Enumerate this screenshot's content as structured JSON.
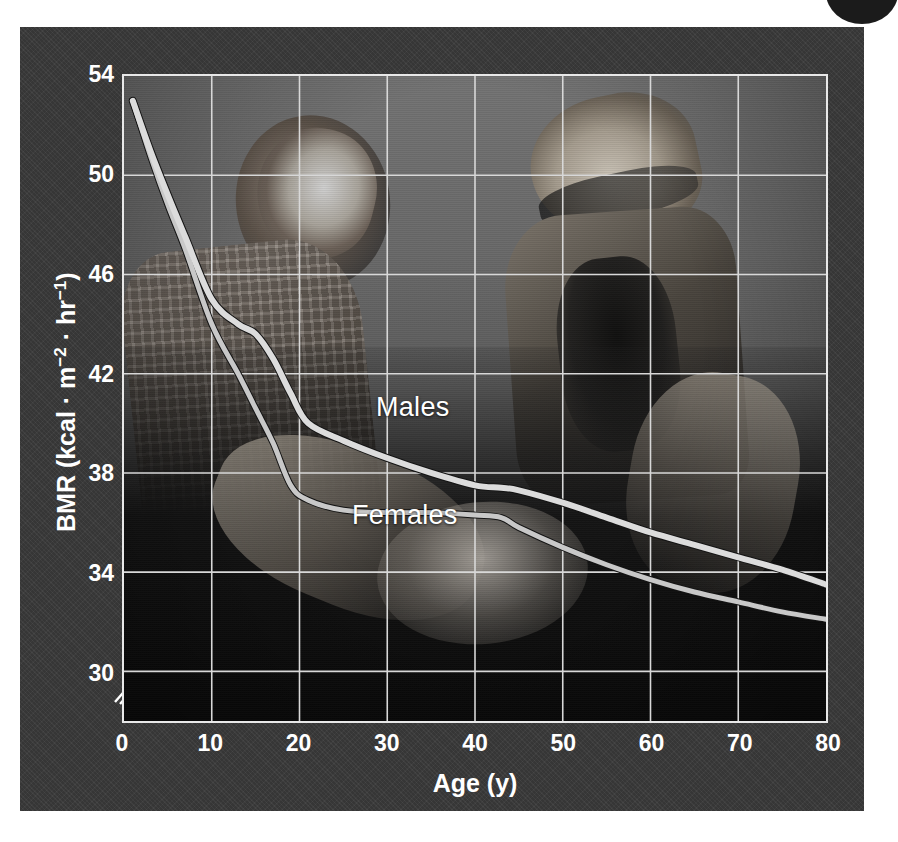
{
  "figure": {
    "background_color": "#3a3a3a",
    "plot_frame_color": "#e8e8e8",
    "grid_color": "#d8d8d8",
    "males_color": "#dcdcdc",
    "females_color": "#c8c8c8"
  },
  "chart_data": {
    "type": "line",
    "title": "",
    "xlabel": "Age (y)",
    "ylabel": "BMR (kcal · m−2 · hr−1)",
    "ylabel_parts": {
      "prefix": "BMR (kcal · m",
      "sup1": "−2",
      "middle": " · hr",
      "sup2": "−1",
      "suffix": ")"
    },
    "xlim": [
      0,
      80
    ],
    "ylim": [
      28,
      54
    ],
    "xticks": [
      0,
      10,
      20,
      30,
      40,
      50,
      60,
      70,
      80
    ],
    "xticklabels": [
      "0",
      "10",
      "20",
      "30",
      "40",
      "50",
      "60",
      "70",
      "80"
    ],
    "yticks": [
      30,
      34,
      38,
      42,
      46,
      50,
      54
    ],
    "yticklabels": [
      "30",
      "34",
      "38",
      "42",
      "46",
      "50",
      "54"
    ],
    "grid": true,
    "legend_position": "inline-annotations",
    "axis_break": "y-axis below 30",
    "series": [
      {
        "name": "Males",
        "label": "Males",
        "x": [
          1,
          3,
          5,
          7,
          10,
          13,
          15,
          17,
          19,
          21,
          25,
          30,
          35,
          40,
          43,
          45,
          50,
          55,
          60,
          65,
          70,
          75,
          80
        ],
        "y": [
          53.0,
          51.0,
          49.2,
          47.5,
          45.0,
          44.0,
          43.6,
          42.6,
          41.2,
          40.0,
          39.3,
          38.6,
          38.0,
          37.5,
          37.4,
          37.3,
          36.8,
          36.2,
          35.6,
          35.1,
          34.6,
          34.1,
          33.5
        ]
      },
      {
        "name": "Females",
        "label": "Females",
        "x": [
          1,
          3,
          5,
          7,
          10,
          13,
          15,
          17,
          19,
          21,
          25,
          30,
          35,
          40,
          43,
          45,
          50,
          55,
          60,
          65,
          70,
          75,
          80
        ],
        "y": [
          53.0,
          50.8,
          48.8,
          47.0,
          44.0,
          42.0,
          40.6,
          39.2,
          37.5,
          36.9,
          36.5,
          36.4,
          36.4,
          36.3,
          36.2,
          35.8,
          35.0,
          34.3,
          33.7,
          33.2,
          32.8,
          32.4,
          32.1
        ]
      }
    ],
    "annotations": [
      {
        "text": "Males",
        "x": 27,
        "y": 39.8
      },
      {
        "text": "Females",
        "x": 24,
        "y": 35.6
      }
    ]
  }
}
